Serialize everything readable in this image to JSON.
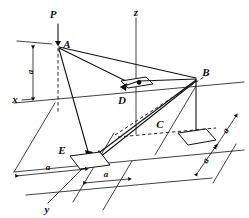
{
  "figure": {
    "type": "engineering-diagram",
    "background_color": "#ffffff",
    "line_color": "#111111",
    "axes": [
      {
        "id": "x",
        "label": "x"
      },
      {
        "id": "y",
        "label": "y"
      },
      {
        "id": "z",
        "label": "z"
      }
    ],
    "load": {
      "label": "P",
      "direction": "downward",
      "applied_at": "A"
    },
    "points": [
      {
        "id": "A",
        "label": "A"
      },
      {
        "id": "B",
        "label": "B"
      },
      {
        "id": "C",
        "label": "C"
      },
      {
        "id": "D",
        "label": "D"
      },
      {
        "id": "E",
        "label": "E"
      }
    ],
    "dimensions": [
      {
        "id": "vertical-a",
        "label": "a",
        "orientation": "vertical",
        "location": "left"
      },
      {
        "id": "bottom-left-a",
        "label": "a",
        "orientation": "horizontal",
        "location": "bottom-left"
      },
      {
        "id": "bottom-right-a",
        "label": "a",
        "orientation": "horizontal",
        "location": "bottom-center"
      },
      {
        "id": "right-upper-a",
        "label": "a",
        "orientation": "diagonal",
        "location": "right-upper"
      },
      {
        "id": "right-lower-a",
        "label": "a",
        "orientation": "diagonal",
        "location": "right-lower"
      }
    ],
    "plates": [
      {
        "id": "plate-D",
        "anchor": "D"
      },
      {
        "id": "plate-C",
        "anchor": "C"
      },
      {
        "id": "plate-E",
        "anchor": "E"
      }
    ],
    "members": [
      {
        "from": "A",
        "to": "B"
      },
      {
        "from": "A",
        "to": "D"
      },
      {
        "from": "A",
        "to": "E"
      },
      {
        "from": "B",
        "to": "D"
      },
      {
        "from": "B",
        "to": "E"
      },
      {
        "from": "B",
        "to": "C"
      }
    ]
  }
}
